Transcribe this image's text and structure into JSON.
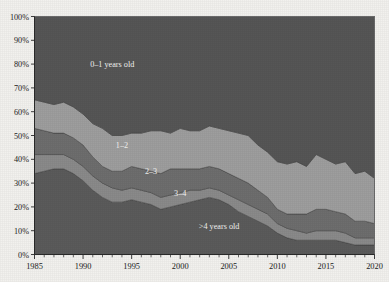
{
  "chart_data": {
    "type": "area",
    "title": "",
    "xlabel": "",
    "ylabel": "",
    "stacked": true,
    "normalized_percent": true,
    "grid": false,
    "legend_position": "inline-annotations",
    "xlim": [
      1985,
      2020
    ],
    "ylim": [
      0,
      100
    ],
    "y_tick_labels": [
      "0%",
      "10%",
      "20%",
      "30%",
      "40%",
      "50%",
      "60%",
      "70%",
      "80%",
      "90%",
      "100%"
    ],
    "y_tick_values": [
      0,
      10,
      20,
      30,
      40,
      50,
      60,
      70,
      80,
      90,
      100
    ],
    "x_tick_labels": [
      "1985",
      "1990",
      "1995",
      "2000",
      "2005",
      "2010",
      "2015",
      "2020"
    ],
    "x_tick_values": [
      1985,
      1990,
      1995,
      2000,
      2005,
      2010,
      2015,
      2020
    ],
    "x_minor_tick_step": 1,
    "categories": [
      1985,
      1986,
      1987,
      1988,
      1989,
      1990,
      1991,
      1992,
      1993,
      1994,
      1995,
      1996,
      1997,
      1998,
      1999,
      2000,
      2001,
      2002,
      2003,
      2004,
      2005,
      2006,
      2007,
      2008,
      2009,
      2010,
      2011,
      2012,
      2013,
      2014,
      2015,
      2016,
      2017,
      2018,
      2019,
      2020
    ],
    "annotations": [
      {
        "text": "0–1 years old",
        "x": 1993,
        "y": 80
      },
      {
        "text": "1–2",
        "x": 1994,
        "y": 46
      },
      {
        "text": "2–3",
        "x": 1997,
        "y": 35
      },
      {
        "text": "3–4",
        "x": 2000,
        "y": 26
      },
      {
        "text": ">4 years old",
        "x": 2004,
        "y": 12
      }
    ],
    "series": [
      {
        "name": ">4 years old",
        "order": 1,
        "color": "#5b5b5b",
        "values": [
          34,
          35,
          36,
          36,
          34,
          31,
          27,
          24,
          22,
          22,
          23,
          22,
          21,
          19,
          20,
          21,
          22,
          23,
          24,
          23,
          21,
          18,
          16,
          14,
          12,
          9,
          7,
          6,
          6,
          6,
          6,
          6,
          5,
          4,
          4,
          4
        ]
      },
      {
        "name": "3–4",
        "order": 2,
        "color": "#8a8a8a",
        "values": [
          8,
          7,
          6,
          6,
          6,
          6,
          6,
          6,
          6,
          5,
          5,
          5,
          5,
          5,
          5,
          5,
          5,
          4,
          4,
          4,
          4,
          5,
          5,
          5,
          5,
          4,
          4,
          4,
          3,
          4,
          4,
          4,
          4,
          3,
          3,
          3
        ]
      },
      {
        "name": "2–3",
        "order": 3,
        "color": "#6e6e6e",
        "values": [
          11,
          10,
          9,
          9,
          9,
          9,
          8,
          7,
          7,
          8,
          9,
          9,
          9,
          10,
          11,
          10,
          9,
          9,
          9,
          9,
          9,
          9,
          9,
          8,
          7,
          6,
          6,
          7,
          8,
          9,
          9,
          8,
          8,
          7,
          7,
          6
        ]
      },
      {
        "name": "1–2",
        "order": 4,
        "color": "#9e9e9e",
        "values": [
          12,
          12,
          12,
          13,
          13,
          13,
          14,
          16,
          15,
          15,
          14,
          15,
          17,
          18,
          15,
          17,
          16,
          16,
          17,
          17,
          18,
          19,
          20,
          19,
          19,
          20,
          21,
          22,
          20,
          23,
          21,
          20,
          22,
          20,
          21,
          19
        ]
      },
      {
        "name": "0–1 years old",
        "order": 5,
        "color": "#565656",
        "values": [
          35,
          36,
          37,
          36,
          38,
          41,
          45,
          47,
          50,
          50,
          49,
          49,
          48,
          48,
          49,
          47,
          48,
          48,
          46,
          47,
          48,
          49,
          50,
          54,
          57,
          61,
          62,
          61,
          63,
          58,
          60,
          62,
          61,
          66,
          65,
          68
        ]
      }
    ]
  }
}
